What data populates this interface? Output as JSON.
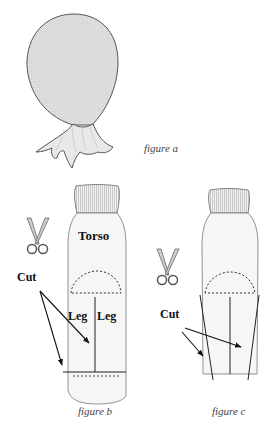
{
  "figures": {
    "a": {
      "caption": "figure a",
      "shape": "stuffed-head-with-ruffled-neck"
    },
    "b": {
      "caption": "figure b",
      "labels": {
        "torso": "Torso",
        "leg_left": "Leg",
        "leg_right": "Leg",
        "cut": "Cut"
      },
      "icon": "scissors-icon"
    },
    "c": {
      "caption": "figure c",
      "labels": {
        "cut": "Cut"
      },
      "icon": "scissors-icon"
    }
  },
  "colors": {
    "fill_gray": "#dcdcdc",
    "fill_light": "#f4f4f4",
    "stroke": "#333333",
    "caption": "#444444"
  }
}
